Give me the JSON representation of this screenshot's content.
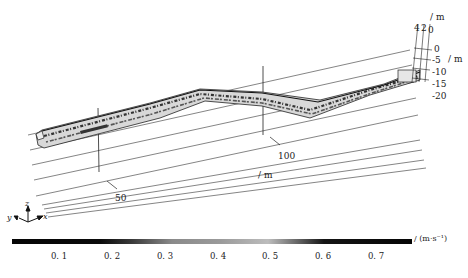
{
  "figure": {
    "type": "3d-tunnel-velocity-field",
    "x_axis": {
      "unit": "/ m",
      "ticks": [
        "50",
        "100"
      ]
    },
    "y_axis": {
      "unit": "/ m",
      "ticks": [
        "4",
        "2",
        "0"
      ]
    },
    "z_axis": {
      "unit": "/ m",
      "ticks": [
        "0",
        "-5",
        "-10",
        "-15",
        "-20"
      ]
    },
    "triad": {
      "x": "x",
      "y": "y",
      "z": "z"
    }
  },
  "colorbar": {
    "unit": "/ (m·s⁻¹)",
    "ticks": [
      "0. 1",
      "0. 2",
      "0. 3",
      "0. 4",
      "0. 5",
      "0. 6",
      "0. 7"
    ],
    "range": [
      0.0,
      0.8
    ],
    "colormap": "grayscale (dark at ends, light around 0.5)"
  }
}
